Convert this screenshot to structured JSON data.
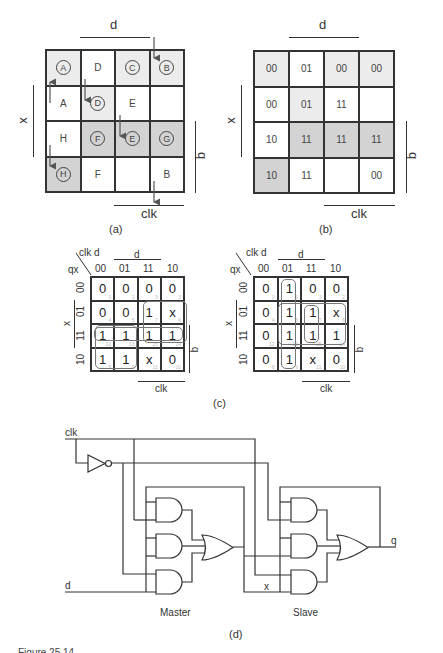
{
  "map_a": {
    "top_label": "d",
    "left_label": "x",
    "right_label": "q",
    "bottom_label": "clk",
    "caption": "(a)",
    "cells": [
      [
        {
          "text": "A",
          "circled": true,
          "shade": 1
        },
        {
          "text": "D",
          "circled": false,
          "shade": 0
        },
        {
          "text": "C",
          "circled": true,
          "shade": 1
        },
        {
          "text": "B",
          "circled": true,
          "shade": 1
        }
      ],
      [
        {
          "text": "A",
          "circled": false,
          "shade": 0
        },
        {
          "text": "D",
          "circled": true,
          "shade": 1
        },
        {
          "text": "E",
          "circled": false,
          "shade": 0
        },
        {
          "text": "",
          "circled": false,
          "shade": 0
        }
      ],
      [
        {
          "text": "H",
          "circled": false,
          "shade": 0
        },
        {
          "text": "F",
          "circled": true,
          "shade": 2
        },
        {
          "text": "E",
          "circled": true,
          "shade": 2
        },
        {
          "text": "G",
          "circled": true,
          "shade": 2
        }
      ],
      [
        {
          "text": "H",
          "circled": true,
          "shade": 2
        },
        {
          "text": "F",
          "circled": false,
          "shade": 0
        },
        {
          "text": "",
          "circled": false,
          "shade": 0
        },
        {
          "text": "B",
          "circled": false,
          "shade": 0
        }
      ]
    ]
  },
  "map_b": {
    "top_label": "d",
    "left_label": "x",
    "right_label": "q",
    "bottom_label": "clk",
    "caption": "(b)",
    "cells": [
      [
        {
          "text": "00",
          "shade": 1
        },
        {
          "text": "01",
          "shade": 0
        },
        {
          "text": "00",
          "shade": 1
        },
        {
          "text": "00",
          "shade": 1
        }
      ],
      [
        {
          "text": "00",
          "shade": 0
        },
        {
          "text": "01",
          "shade": 1
        },
        {
          "text": "11",
          "shade": 0
        },
        {
          "text": "",
          "shade": 0
        }
      ],
      [
        {
          "text": "10",
          "shade": 0
        },
        {
          "text": "11",
          "shade": 2
        },
        {
          "text": "11",
          "shade": 2
        },
        {
          "text": "11",
          "shade": 2
        }
      ],
      [
        {
          "text": "10",
          "shade": 2
        },
        {
          "text": "11",
          "shade": 0
        },
        {
          "text": "",
          "shade": 0
        },
        {
          "text": "00",
          "shade": 0
        }
      ]
    ]
  },
  "map_c": {
    "caption": "(c)",
    "corner_col": "clk d",
    "corner_row": "qx",
    "col_headers": [
      "00",
      "01",
      "11",
      "10"
    ],
    "row_headers": [
      "00",
      "01",
      "11",
      "10"
    ],
    "indices": [
      [
        "0",
        "1",
        "3",
        "2"
      ],
      [
        "4",
        "5",
        "7",
        "6"
      ],
      [
        "12",
        "13",
        "15",
        "14"
      ],
      [
        "8",
        "9",
        "11",
        "10"
      ]
    ],
    "left": {
      "top_label": "d",
      "left_label": "x",
      "right_label": "q",
      "bottom_label": "clk",
      "cells": [
        [
          "0",
          "0",
          "0",
          "0"
        ],
        [
          "0",
          "0",
          "1",
          "x"
        ],
        [
          "1",
          "1",
          "1",
          "1"
        ],
        [
          "1",
          "1",
          "x",
          "0"
        ]
      ]
    },
    "right": {
      "top_label": "d",
      "left_label": "x",
      "right_label": "q",
      "bottom_label": "clk",
      "cells": [
        [
          "0",
          "1",
          "0",
          "0"
        ],
        [
          "0",
          "1",
          "1",
          "x"
        ],
        [
          "0",
          "1",
          "1",
          "1"
        ],
        [
          "0",
          "1",
          "x",
          "0"
        ]
      ]
    }
  },
  "circuit": {
    "caption": "(d)",
    "input_clk": "clk",
    "input_d": "d",
    "intermediate": "x",
    "output": "q",
    "master_label": "Master",
    "slave_label": "Slave"
  },
  "figure_caption": "Figure 25.14 ..."
}
